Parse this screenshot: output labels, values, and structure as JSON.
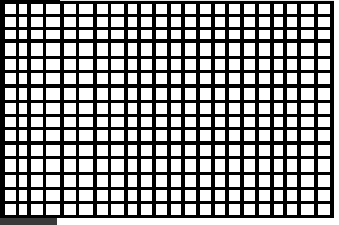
{
  "image": {
    "description": "Black grid pattern with white rectangular cells of irregular sizes",
    "background_color": "#000000",
    "cell_color": "#ffffff",
    "columns": [
      [
        5,
        11
      ],
      [
        19,
        8
      ],
      [
        31,
        12
      ],
      [
        46,
        14
      ],
      [
        64,
        12
      ],
      [
        79,
        14
      ],
      [
        97,
        11
      ],
      [
        111,
        13
      ],
      [
        128,
        9
      ],
      [
        141,
        11
      ],
      [
        156,
        11
      ],
      [
        171,
        10
      ],
      [
        185,
        11
      ],
      [
        200,
        11
      ],
      [
        215,
        10
      ],
      [
        229,
        11
      ],
      [
        244,
        11
      ],
      [
        259,
        11
      ],
      [
        274,
        9
      ],
      [
        287,
        10
      ],
      [
        301,
        13
      ],
      [
        318,
        12
      ]
    ],
    "rows": [
      [
        4,
        10
      ],
      [
        17,
        10
      ],
      [
        30,
        9
      ],
      [
        43,
        13
      ],
      [
        59,
        11
      ],
      [
        73,
        11
      ],
      [
        88,
        12
      ],
      [
        103,
        11
      ],
      [
        117,
        10
      ],
      [
        130,
        11
      ],
      [
        145,
        11
      ],
      [
        159,
        13
      ],
      [
        175,
        12
      ],
      [
        190,
        11
      ],
      [
        204,
        11
      ]
    ]
  },
  "status_strip": {
    "color": "#3a3a3a"
  }
}
